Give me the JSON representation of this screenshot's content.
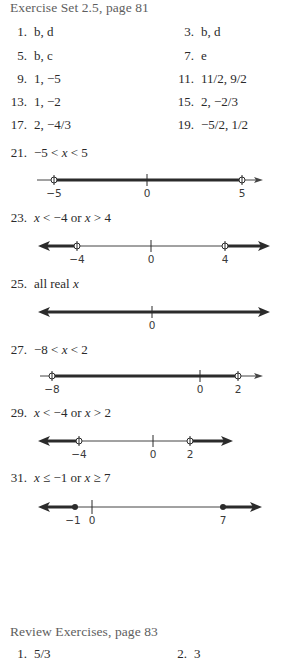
{
  "section1": {
    "title": "Exercise Set 2.5, page 81",
    "items": [
      {
        "num": "1.",
        "answer": "b, d"
      },
      {
        "num": "3.",
        "answer": "b, d"
      },
      {
        "num": "5.",
        "answer": "b, c"
      },
      {
        "num": "7.",
        "answer": "e"
      },
      {
        "num": "9.",
        "answer": "1, −5"
      },
      {
        "num": "11.",
        "answer": "11/2, 9/2"
      },
      {
        "num": "13.",
        "answer": "1, −2"
      },
      {
        "num": "15.",
        "answer": "2, −2/3"
      },
      {
        "num": "17.",
        "answer": "2, −4/3"
      },
      {
        "num": "19.",
        "answer": "−5/2, 1/2"
      }
    ],
    "graphs": [
      {
        "num": "21.",
        "answer": "−5 < x < 5",
        "ticks": [
          {
            "label": "−5"
          },
          {
            "label": "0"
          },
          {
            "label": "5"
          }
        ]
      },
      {
        "num": "23.",
        "answer": "x < −4 or x > 4",
        "ticks": [
          {
            "label": "−4"
          },
          {
            "label": "0"
          },
          {
            "label": "4"
          }
        ]
      },
      {
        "num": "25.",
        "answer": "all real x",
        "ticks": [
          {
            "label": "0"
          }
        ]
      },
      {
        "num": "27.",
        "answer": "−8 < x < 2",
        "ticks": [
          {
            "label": "−8"
          },
          {
            "label": "0"
          },
          {
            "label": "2"
          }
        ]
      },
      {
        "num": "29.",
        "answer": "x < −4 or x > 2",
        "ticks": [
          {
            "label": "−4"
          },
          {
            "label": "0"
          },
          {
            "label": "2"
          }
        ]
      },
      {
        "num": "31.",
        "answer": "x ≤ −1 or x ≥ 7",
        "ticks": [
          {
            "label": "−1"
          },
          {
            "label": "0"
          },
          {
            "label": "7"
          }
        ]
      }
    ]
  },
  "section2": {
    "title": "Review Exercises, page 83",
    "items": [
      {
        "num": "1.",
        "answer": "5/3"
      },
      {
        "num": "2.",
        "answer": "3"
      }
    ]
  },
  "colors": {
    "text": "#2a2a2a",
    "heading": "#5e5e5e",
    "line": "#2b2b2b"
  }
}
